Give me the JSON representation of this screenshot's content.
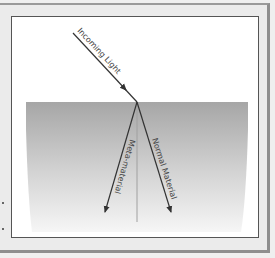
{
  "diagram": {
    "labels": {
      "incoming": "Incoming Light",
      "meta": "Meta-material",
      "normal": "Normal Material"
    },
    "colors": {
      "frame_bg": "#ebebeb",
      "panel_bg": "#ffffff",
      "medium_top": "#a8a8a8",
      "medium_bottom": "#f4f4f4",
      "arrow": "#333333",
      "normal_line": "#999999"
    }
  }
}
